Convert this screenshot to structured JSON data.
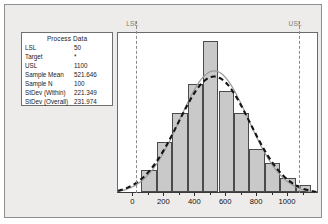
{
  "panel": {
    "background_color": "#edecea",
    "border_color": "#8f8f8f"
  },
  "process_data": {
    "title": "Process Data",
    "rows": [
      {
        "label": "LSL",
        "value": "50"
      },
      {
        "label": "Target",
        "value": "*"
      },
      {
        "label": "USL",
        "value": "1100"
      },
      {
        "label": "Sample Mean",
        "value": "521.646"
      },
      {
        "label": "Sample N",
        "value": "100"
      },
      {
        "label": "StDev (Within)",
        "value": "221.349"
      },
      {
        "label": "StDev (Overall)",
        "value": "231.974"
      }
    ]
  },
  "spec_limits": {
    "lsl_label": "LSL",
    "usl_label": "USL",
    "lsl_value": 50,
    "usl_value": 1100,
    "line_color": "#8a8a8a",
    "label_color": "#7d7d7d"
  },
  "chart_data": {
    "type": "bar",
    "title": "",
    "xlabel": "",
    "ylabel": "",
    "xlim": [
      -100,
      1200
    ],
    "xticks": [
      0,
      200,
      400,
      600,
      800,
      1000
    ],
    "xtick_labels": [
      "0",
      "200",
      "400",
      "600",
      "800",
      "1000"
    ],
    "grid": false,
    "legend": "none",
    "bar_color": "#c9c9c9",
    "bar_edge_color": "#4b4b4b",
    "bin_edges": [
      50,
      150,
      250,
      350,
      450,
      550,
      650,
      750,
      850,
      950,
      1050,
      1150
    ],
    "bin_centers": [
      100,
      200,
      300,
      400,
      500,
      600,
      700,
      800,
      900,
      1000,
      1100
    ],
    "values": [
      3,
      7,
      11,
      15,
      21,
      14,
      11,
      6,
      4,
      2,
      1
    ],
    "series": [
      {
        "name": "Within",
        "type": "line",
        "style": "solid",
        "color": "#9a9a9a",
        "mean": 521.646,
        "stdev": 221.349
      },
      {
        "name": "Overall",
        "type": "line",
        "style": "dashed",
        "color": "#141414",
        "mean": 521.646,
        "stdev": 231.974
      }
    ]
  }
}
